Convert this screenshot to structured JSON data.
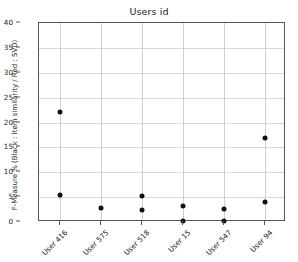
{
  "chart_data": {
    "type": "scatter",
    "title": "Users id",
    "xlabel": "",
    "ylabel": "F-Measure % (Black : Item similarity / Red : SVD)",
    "categories": [
      "User 416",
      "User 575",
      "User 518",
      "User 15",
      "User 547",
      "User 94"
    ],
    "ylim": [
      0,
      40
    ],
    "yticks": [
      0,
      5,
      10,
      15,
      20,
      25,
      30,
      35,
      40
    ],
    "ytick_labels": [
      "0",
      "5",
      "10",
      "15",
      "20",
      "25",
      "30",
      "35",
      "40"
    ],
    "grid": true,
    "legend": "none",
    "point_color": "#111111",
    "series": [
      {
        "name": "Item similarity",
        "color": "#111111",
        "points": [
          {
            "category": "User 416",
            "values": [
              22.1,
              5.4
            ]
          },
          {
            "category": "User 575",
            "values": [
              2.8
            ]
          },
          {
            "category": "User 518",
            "values": [
              5.2,
              2.4
            ]
          },
          {
            "category": "User 15",
            "values": [
              3.2,
              0.2
            ]
          },
          {
            "category": "User 547",
            "values": [
              2.6,
              0.2
            ]
          },
          {
            "category": "User 94",
            "values": [
              16.9,
              4.0
            ]
          }
        ]
      }
    ]
  }
}
